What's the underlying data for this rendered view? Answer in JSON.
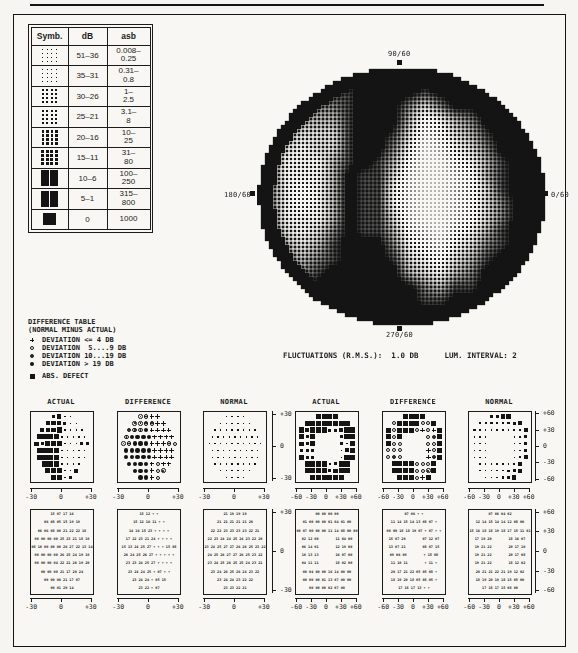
{
  "page": {
    "ink": "#1b1b1b"
  },
  "legend": {
    "headers": [
      "Symb.",
      "dB",
      "asb"
    ],
    "rows": [
      {
        "db": "51–36",
        "asb": "0.008–\n0.25",
        "dot": 1.0,
        "solid": false
      },
      {
        "db": "35–31",
        "asb": "0.31–\n0.8",
        "dot": 1.3,
        "solid": false
      },
      {
        "db": "30–26",
        "asb": "1–\n2.5",
        "dot": 1.6,
        "solid": false
      },
      {
        "db": "25–21",
        "asb": "3.1–\n8",
        "dot": 2.0,
        "solid": false
      },
      {
        "db": "20–16",
        "asb": "10–\n25",
        "dot": 2.5,
        "solid": false
      },
      {
        "db": "15–11",
        "asb": "31–\n80",
        "dot": 3.0,
        "solid": false
      },
      {
        "db": "10–6",
        "asb": "100–\n250",
        "dot": 3.6,
        "solid": false
      },
      {
        "db": "5–1",
        "asb": "315–\n800",
        "dot": 4.2,
        "solid": false
      },
      {
        "db": "0",
        "asb": "1000",
        "dot": 0,
        "solid": true
      }
    ]
  },
  "grayscale": {
    "labels": {
      "top": "90/60",
      "left": "180/60",
      "right": "0/60",
      "bottom": "270/60"
    },
    "map": [
      "99999999999999999999",
      "99999999999999999999",
      "99988889999899999999",
      "99877789997579999999",
      "98766689996346799999",
      "98655589985235689999",
      "97545589974124579999",
      "97444689863113468999",
      "87444698852112368999",
      "87434698842112358999",
      "87434698842112357999",
      "87444698852112357999",
      "97545798863213468999",
      "97656899974324578999",
      "98767899985435689999",
      "99878999996546799999",
      "99989999999768899999",
      "99999999999889999999",
      "99999999999999999999",
      "99999999999999999999"
    ]
  },
  "difference_legend": {
    "title": "DIFFERENCE TABLE",
    "subtitle": "(NORMAL MINUS ACTUAL)",
    "items": [
      {
        "sym": "+",
        "label": "DEVIATION <= 4 DB"
      },
      {
        "sym": "o",
        "label": "DEVIATION  5....9 DB"
      },
      {
        "sym": "0",
        "label": "DEVIATION 10...19 DB"
      },
      {
        "sym": "*",
        "label": "DEVIATION > 19 DB"
      },
      {
        "sym": "#",
        "label": "ABS. DEFECT"
      }
    ]
  },
  "fluctuations_line": {
    "left": "FLUCTUATIONS (R.M.S.):  1.0 DB",
    "right": "LUM. INTERVAL: 2"
  },
  "axes": {
    "y_central": [
      "+30",
      "0",
      "-30"
    ],
    "y_peripheral": [
      "+60",
      "+30",
      "0",
      "-30",
      "-60"
    ],
    "x_central": [
      "-30",
      "0",
      "+30"
    ],
    "x_peripheral": [
      "-60",
      "-30",
      "0",
      "+30",
      "+60"
    ]
  },
  "plots": [
    {
      "title": "ACTUAL",
      "xscale": "central",
      "rows": [
        "23..",
        "3332..",
        "3334....",
        "4444.....",
        "32444...22",
        "4444.....",
        "4444.....",
        "444....",
        "444..3",
        "44.2"
      ]
    },
    {
      "title": "DIFFERENCE",
      "xscale": "central",
      "rows": [
        "00++",
        "0000++",
        "000*++++",
        "0****++++",
        "00***+++0o",
        "*****++++",
        "*****++++",
        "****+o++",
        "***+o0",
        "**+o"
      ]
    },
    {
      "title": "NORMAL",
      "xscale": "central",
      "rows": [
        "....",
        "......",
        "........",
        ".........",
        "..........",
        ".........",
        ".........",
        "........",
        "......",
        "...."
      ]
    },
    {
      "title": "ACTUAL",
      "xscale": "peripheral",
      "rows": [
        "4444",
        "44444444",
        "4344422344",
        "424    244",
        "324    2.4",
        "222    .34",
        "422    .44",
        "4444.244",
        "44442344",
        "444434"
      ]
    },
    {
      "title": "DIFFERENCE",
      "xscale": "peripheral",
      "rows": [
        "####",
        "o####oo#",
        "#o###o+o+#",
        "#o#    o0#",
        "#oo    oo#",
        "ooo    +o#",
        "o0o    +0#",
        "####ooo#",
        "####oo0#",
        "###o+#"
      ]
    },
    {
      "title": "NORMAL",
      "xscale": "peripheral",
      "rows": [
        "2233",
        "::::::23",
        ":......::3",
        "...    ..2",
        "...    ..:",
        "...    ..2",
        "...    .:3",
        "......:3",
        ".....:23",
        "...:23"
      ]
    }
  ],
  "value_tables": [
    {
      "name": "actual-central",
      "xscale": "central",
      "rows": [
        "15 07 17 16",
        "06 08 05 15 19 19",
        "06 06 08 00 21 22 22 18",
        "00 00 00 00 25 23 21 18 19",
        "08 10 00 00 00 26 27 22 13 14",
        "00 00 00 00 26 25 24 19 19",
        "00 00 00 04 22 21 20 19 20",
        "00 00 00 21 17 20 24",
        "00 00 00 21 17 07",
        "00 01 20 14"
      ]
    },
    {
      "name": "difference-central",
      "xscale": "central",
      "rows": [
        "15 12 + +",
        "15 12 16 11 + +",
        "14 16 15 23 + + + +",
        "17 22 23 21 24 + + + +",
        "15 13 24 25 27 + + + 15 08",
        "20 24 25 26 27 + + + + +",
        "23 23 24 25 27 + + + +",
        "23 24 24 25 + 07 + +",
        "23 24 24 + 05 15",
        "23 22 + 07"
      ]
    },
    {
      "name": "normal-central",
      "xscale": "central",
      "rows": [
        "21 19 19 19",
        "21 21 21 21 21 20",
        "22 22 23 23 23 23 22 21",
        "22 23 24 24 25 24 23 22 20",
        "23 24 25 27 27 26 26 25 23 22",
        "24 25 26 27 27 26 25 23 22",
        "23 24 25 26 25 25 24 23 21",
        "23 24 26 25 26 24 23 22",
        "23 24 24 23 22 22",
        "23 23 22 21"
      ]
    },
    {
      "name": "actual-peripheral",
      "xscale": "peripheral",
      "rows": [
        "00 00 00 00",
        "01 00 00 00 01 04 01 00",
        "00 07 00 00 00 11 14 08 00 00",
        "02 12 00        11 04 00",
        "06 14 01        12 19 00",
        "10 13 13        16 07 00",
        "04 11 11        18 02 00",
        "00 04 00 00 16 14 00 00",
        "00 00 00 01 13 07 00 00",
        "00 00 00 02 07 00"
      ]
    },
    {
      "name": "difference-peripheral",
      "xscale": "peripheral",
      "rows": [
        "07 06 + +",
        "11 14 15 14 13 08 07 +",
        "00 09 18 18 19 07 + 07 + +",
        "15 07 20        07 12 07",
        "13 07 21        08 07 15",
        "09 06 09        + 15 08",
        "11 10 11        + 11 +",
        "20 17 21 22 05 05 08 +",
        "18 19 20 18 05 08 05 +",
        "17 18 17 13 + +"
      ]
    },
    {
      "name": "normal-peripheral",
      "xscale": "peripheral",
      "rows": [
        "07 06 04 02",
        "12 14 15 14 14 12 08 00",
        "15 16 18 18 19 18 17 15 11 01",
        "17 19 20        18 16 07",
        "19 21 22        20 17 10",
        "19 21 22        20 17 08",
        "19 21 22        18 12 02",
        "20 21 21 22 21 19 12 02",
        "18 19 20 19 18 15 05 00",
        "17 18 17 15 08 00"
      ]
    }
  ]
}
